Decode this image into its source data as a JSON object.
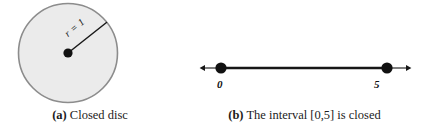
{
  "figure": {
    "background_color": "#ffffff",
    "panels": [
      {
        "id": "a",
        "tag": "(a)",
        "caption_text": "Closed disc",
        "type": "closed-disc",
        "disc": {
          "fill_color": "#ebebeb",
          "stroke_color": "#8c8c8c",
          "center_dot_color": "#111111",
          "radius_line_color": "#1a1a1a",
          "radius_label": "r = 1"
        }
      },
      {
        "id": "b",
        "tag": "(b)",
        "caption_text": "The interval [0,5] is closed",
        "type": "closed-interval",
        "number_line": {
          "line_color": "#161616",
          "endpoint_dot_color": "#111111",
          "endpoint_style": "closed",
          "left_label": "0",
          "right_label": "5",
          "interval_start": 0,
          "interval_end": 5
        }
      }
    ]
  }
}
